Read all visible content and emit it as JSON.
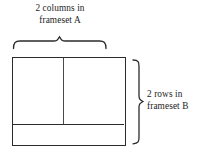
{
  "figure": {
    "background_color": "#ffffff",
    "line_color": "#2b2b2b",
    "divider_color": "#4a4a4a"
  },
  "columns_label": {
    "line_1": "2 columns in",
    "line_2": "frameset A",
    "full_text": "2 columns in frameset A"
  },
  "rows_label": {
    "line_1": "2 rows in",
    "line_2": "frameset B",
    "full_text": "2 rows in frameset B"
  },
  "braces": {
    "top": {
      "name": "top-curly-brace",
      "orientation": "down",
      "spans": "columns of frameset A"
    },
    "right": {
      "name": "right-curly-brace",
      "orientation": "right",
      "spans": "rows of frameset B"
    }
  },
  "frame_box": {
    "name": "frameset-diagram-box",
    "columns": 2,
    "rows": 2,
    "cells": [
      {
        "name": "top-left-frame"
      },
      {
        "name": "top-right-frame"
      },
      {
        "name": "bottom-frame"
      }
    ]
  }
}
